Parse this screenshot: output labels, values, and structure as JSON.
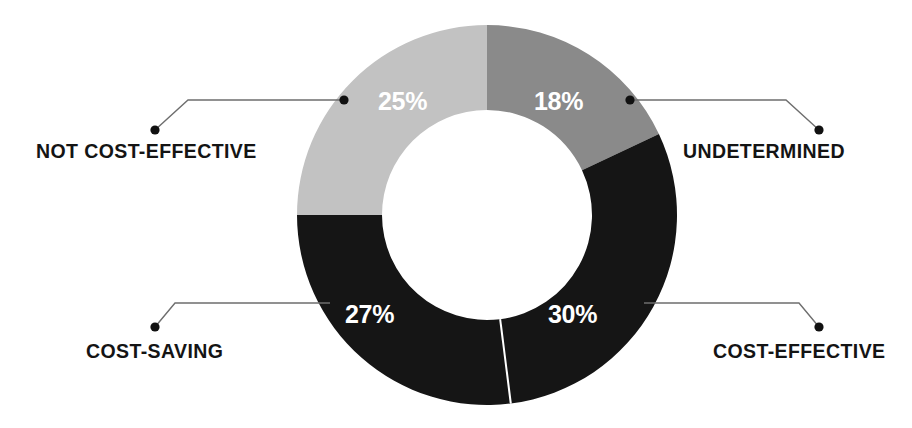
{
  "chart_data": {
    "type": "pie",
    "title": "",
    "subtitle": "",
    "xlabel": "",
    "ylabel": "",
    "variant": "donut",
    "legend_position": "callout-labels",
    "grid": false,
    "total": 100,
    "units": "percent",
    "categories": [
      "UNDETERMINED",
      "COST-EFFECTIVE",
      "COST-SAVING",
      "NOT COST-EFFECTIVE"
    ],
    "values": [
      18,
      30,
      27,
      25
    ],
    "value_labels": [
      "18%",
      "30%",
      "27%",
      "25%"
    ],
    "colors": [
      "#8a8a8a",
      "#151515",
      "#151515",
      "#c2c2c2"
    ],
    "slices": [
      {
        "label": "UNDETERMINED",
        "value": 18,
        "value_label": "18%",
        "color": "#8a8a8a",
        "start_angle_deg": 0,
        "end_angle_deg": 64.8
      },
      {
        "label": "COST-EFFECTIVE",
        "value": 30,
        "value_label": "30%",
        "color": "#151515",
        "start_angle_deg": 64.8,
        "end_angle_deg": 172.8
      },
      {
        "label": "COST-SAVING",
        "value": 27,
        "value_label": "27%",
        "color": "#151515",
        "start_angle_deg": 172.8,
        "end_angle_deg": 270.0
      },
      {
        "label": "NOT COST-EFFECTIVE",
        "value": 25,
        "value_label": "25%",
        "color": "#c2c2c2",
        "start_angle_deg": 270.0,
        "end_angle_deg": 360.0
      }
    ],
    "geometry": {
      "center_x": 487,
      "center_y": 215,
      "outer_radius": 190,
      "inner_radius": 105
    },
    "background_color": "#ffffff",
    "label_text_color": "#141414",
    "value_text_color": "#ffffff",
    "connector_color": "#6e6e6e"
  },
  "labels": {
    "not_cost_effective": "NOT COST-EFFECTIVE",
    "undetermined": "UNDETERMINED",
    "cost_saving": "COST-SAVING",
    "cost_effective": "COST-EFFECTIVE"
  },
  "values": {
    "not_cost_effective": "25%",
    "undetermined": "18%",
    "cost_saving": "27%",
    "cost_effective": "30%"
  }
}
